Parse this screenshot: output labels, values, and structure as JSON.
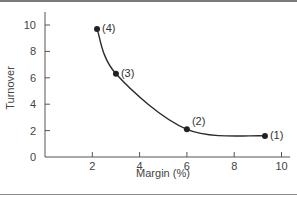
{
  "chart_data": {
    "type": "line",
    "title": "",
    "xlabel": "Margin (%)",
    "ylabel": "Turnover",
    "xlim": [
      0,
      10
    ],
    "ylim": [
      0,
      10
    ],
    "x_ticks": [
      2,
      4,
      6,
      8,
      10
    ],
    "y_ticks": [
      0,
      2,
      4,
      6,
      8,
      10
    ],
    "origin_label": "0",
    "grid": false,
    "legend": null,
    "series": [
      {
        "name": "Turnover vs Margin curve",
        "smooth": true,
        "points": [
          {
            "label": "(4)",
            "x": 2.2,
            "y": 9.7
          },
          {
            "label": "(3)",
            "x": 3.0,
            "y": 6.3
          },
          {
            "label": "(2)",
            "x": 6.0,
            "y": 2.1
          },
          {
            "label": "(1)",
            "x": 9.3,
            "y": 1.6
          }
        ]
      }
    ]
  },
  "colors": {
    "line": "#2a2a2a",
    "axis": "#555555",
    "text": "#444444"
  }
}
